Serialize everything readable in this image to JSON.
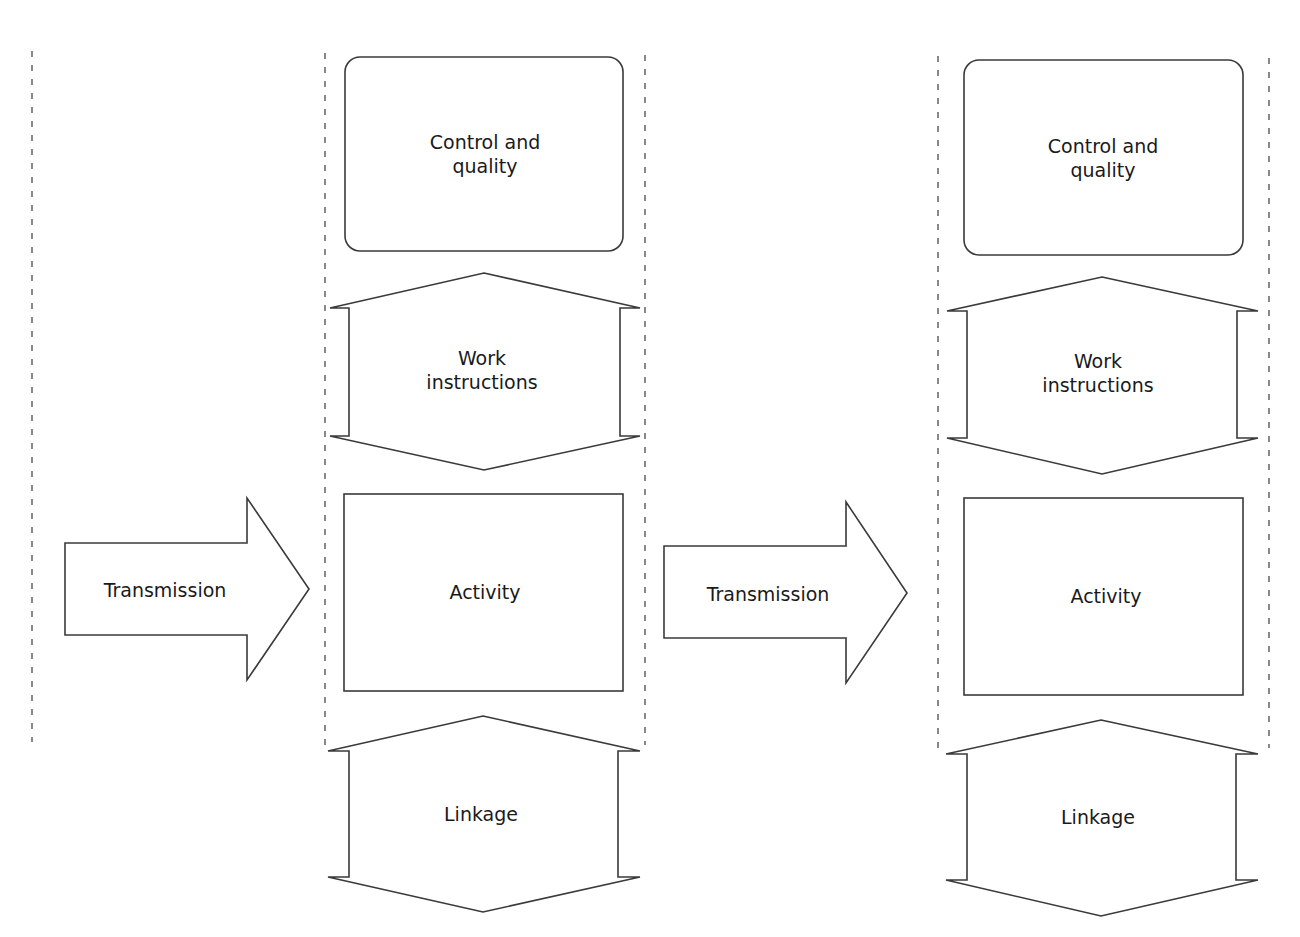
{
  "diagram": {
    "columns": [
      {
        "id": "column-1",
        "control_quality": "Control and\nquality",
        "work_instructions": "Work\ninstructions",
        "activity": "Activity",
        "linkage": "Linkage"
      },
      {
        "id": "column-2",
        "control_quality": "Control and\nquality",
        "work_instructions": "Work\ninstructions",
        "activity": "Activity",
        "linkage": "Linkage"
      }
    ],
    "transmissions": [
      {
        "label": "Transmission"
      },
      {
        "label": "Transmission"
      }
    ],
    "colors": {
      "stroke": "#3a3a3a",
      "fill": "#ffffff",
      "text": "#1a1a1a",
      "dashed": "#4a4a4a"
    }
  }
}
